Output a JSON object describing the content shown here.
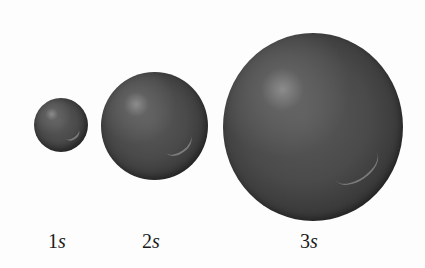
{
  "figure": {
    "background": "#ffffff",
    "sphere_color": "#4a4a4a",
    "orbitals": [
      {
        "n": "1",
        "l": "s",
        "label": "1s",
        "cx": 61,
        "cy": 125,
        "r": 27
      },
      {
        "n": "2",
        "l": "s",
        "label": "2s",
        "cx": 154,
        "cy": 126,
        "r": 54
      },
      {
        "n": "3",
        "l": "s",
        "label": "3s",
        "cx": 313,
        "cy": 126,
        "r": 92
      }
    ]
  }
}
